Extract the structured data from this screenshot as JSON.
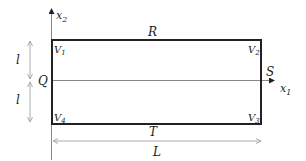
{
  "diagram": {
    "type": "rectangular domain with coordinate axes",
    "axes": {
      "x1_label": "x",
      "x1_sub": "1",
      "x2_label": "x",
      "x2_sub": "2"
    },
    "sides": {
      "top": "R",
      "right": "S",
      "bottom": "T",
      "left": "Q"
    },
    "vertices": [
      {
        "label": "V",
        "sub": "1",
        "position": "top-left"
      },
      {
        "label": "V",
        "sub": "2",
        "position": "top-right"
      },
      {
        "label": "V",
        "sub": "3",
        "position": "bottom-right"
      },
      {
        "label": "V",
        "sub": "4",
        "position": "bottom-left"
      }
    ],
    "dimensions": {
      "upper_half_height": "l",
      "lower_half_height": "l",
      "width": "L"
    },
    "colors": {
      "rectangle": "#222222",
      "axes": "#888888",
      "dimension_arrows": "#aaaaaa",
      "text": "#222222"
    }
  }
}
